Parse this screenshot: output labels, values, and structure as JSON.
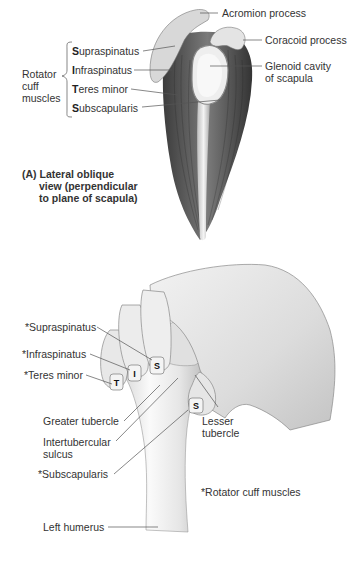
{
  "figure": {
    "panel_a": {
      "caption": {
        "letter": "(A)",
        "line1": "Lateral oblique",
        "line2": "view (perpendicular",
        "line3": "to plane of scapula)"
      },
      "group_label": {
        "line1": "Rotator",
        "line2": "cuff",
        "line3": "muscles"
      },
      "muscles": [
        {
          "initial": "S",
          "rest": "upraspinatus"
        },
        {
          "initial": "I",
          "rest": "nfraspinatus"
        },
        {
          "initial": "T",
          "rest": "eres minor"
        },
        {
          "initial": "S",
          "rest": "ubscapularis"
        }
      ],
      "right_labels": {
        "acromion": "Acromion process",
        "coracoid": "Coracoid process",
        "glenoid_line1": "Glenoid cavity",
        "glenoid_line2": "of scapula"
      }
    },
    "panel_b": {
      "left_labels": {
        "supraspinatus": "*Supraspinatus",
        "infraspinatus": "*Infraspinatus",
        "teres_minor": "*Teres minor",
        "greater_tubercle": "Greater tubercle",
        "intertubercular_line1": "Intertubercular",
        "intertubercular_line2": "sulcus",
        "subscapularis": "*Subscapularis",
        "left_humerus": "Left humerus"
      },
      "right_labels": {
        "lesser_line1": "Lesser",
        "lesser_line2": "tubercle",
        "footnote": "*Rotator cuff muscles"
      },
      "fingernail_letters": {
        "teres_minor": "T",
        "infraspinatus": "I",
        "supraspinatus": "S",
        "subscapularis": "S"
      }
    }
  },
  "colors": {
    "background": "#ffffff",
    "text": "#333333",
    "leader_line": "#555555",
    "muscle_dark": "#4a4a4a",
    "bone_light": "#e6e6e6",
    "skin": "#e2e2e2"
  }
}
